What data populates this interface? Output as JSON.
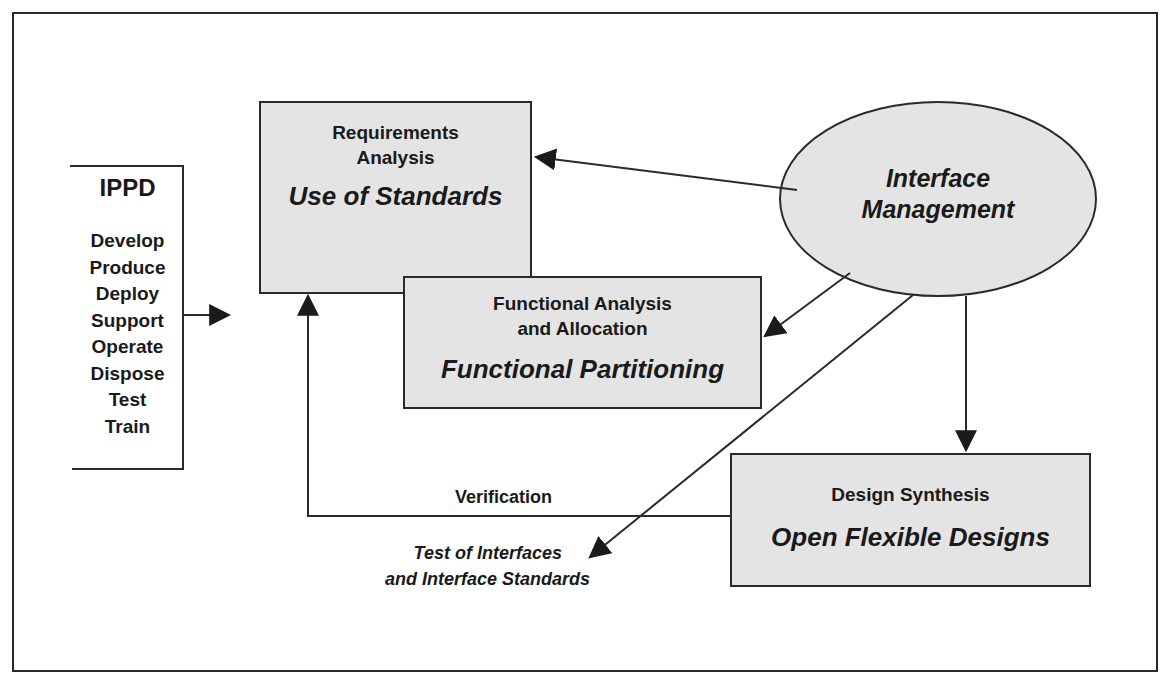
{
  "diagram": {
    "ippd": {
      "title": "IPPD",
      "items": [
        "Develop",
        "Produce",
        "Deploy",
        "Support",
        "Operate",
        "Dispose",
        "Test",
        "Train"
      ]
    },
    "requirements_box": {
      "subtitle_line1": "Requirements",
      "subtitle_line2": "Analysis",
      "main": "Use of Standards"
    },
    "functional_box": {
      "subtitle_line1": "Functional Analysis",
      "subtitle_line2": "and Allocation",
      "main": "Functional Partitioning"
    },
    "design_box": {
      "subtitle": "Design Synthesis",
      "main": "Open Flexible Designs"
    },
    "ellipse": {
      "line1": "Interface",
      "line2": "Management"
    },
    "verification_label": "Verification",
    "test_label": {
      "line1": "Test of Interfaces",
      "line2": "and Interface Standards"
    },
    "colors": {
      "box_fill": "#e4e4e4",
      "line": "#2a2a2a",
      "background": "#ffffff"
    }
  }
}
